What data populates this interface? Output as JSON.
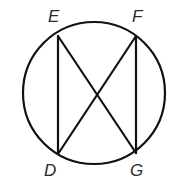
{
  "diagram": {
    "type": "circle-with-inscribed-chords",
    "colors": {
      "stroke": "#111111",
      "label": "#2a2a2a",
      "background": "#ffffff"
    },
    "circle": {
      "cx": 94,
      "cy": 93,
      "r": 71
    },
    "points": [
      {
        "id": "E",
        "label": "E",
        "x": 58,
        "y": 36,
        "label_x": 49,
        "label_y": 22
      },
      {
        "id": "F",
        "label": "F",
        "x": 136,
        "y": 36,
        "label_x": 133,
        "label_y": 22
      },
      {
        "id": "D",
        "label": "D",
        "x": 58,
        "y": 154,
        "label_x": 45,
        "label_y": 176
      },
      {
        "id": "G",
        "label": "G",
        "x": 136,
        "y": 153,
        "label_x": 131,
        "label_y": 176
      }
    ],
    "segments": [
      {
        "id": "ED",
        "from": "E",
        "to": "D"
      },
      {
        "id": "FG",
        "from": "F",
        "to": "G"
      },
      {
        "id": "EG",
        "from": "E",
        "to": "G"
      },
      {
        "id": "FD",
        "from": "F",
        "to": "D"
      }
    ],
    "labels": {
      "E": "E",
      "F": "F",
      "D": "D",
      "G": "G"
    }
  }
}
